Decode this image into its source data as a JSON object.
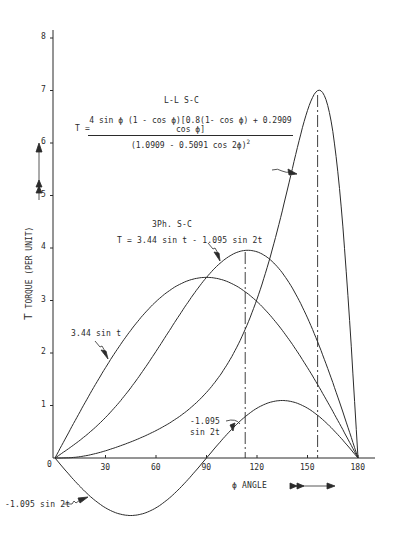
{
  "chart_data": {
    "type": "line",
    "title": "",
    "xlabel": "ϕ ANGLE",
    "ylabel": "T  TORQUE (PER UNIT)",
    "xlim": [
      0,
      180
    ],
    "ylim": [
      -1.2,
      8
    ],
    "x_ticks": [
      0,
      30,
      60,
      90,
      120,
      150,
      180
    ],
    "y_ticks": [
      1,
      2,
      3,
      4,
      5,
      6,
      7,
      8
    ],
    "grid": false,
    "series": [
      {
        "name": "L-L S-C",
        "formula": "T = 4 sinϕ(1-cosϕ)[0.8(1-cosϕ)+0.2909cosϕ]/(1.0909-0.5091cos2ϕ)^2",
        "x": [
          0,
          15,
          30,
          45,
          60,
          75,
          90,
          105,
          120,
          135,
          150,
          156,
          165,
          180
        ],
        "values": [
          0,
          0.02,
          0.1,
          0.3,
          0.66,
          1.2,
          1.92,
          2.82,
          3.93,
          5.2,
          6.54,
          6.99,
          5.65,
          0
        ]
      },
      {
        "name": "3Ph. S-C",
        "formula": "T = 3.44 sin t - 1.095 sin 2t",
        "x": [
          0,
          15,
          30,
          45,
          60,
          75,
          90,
          105,
          113,
          120,
          135,
          150,
          165,
          180
        ],
        "values": [
          0,
          0.34,
          0.77,
          1.34,
          2.03,
          2.78,
          3.44,
          3.87,
          3.96,
          3.93,
          3.53,
          2.67,
          1.44,
          0
        ]
      },
      {
        "name": "3.44 sin t",
        "x": [
          0,
          30,
          60,
          90,
          120,
          150,
          180
        ],
        "values": [
          0,
          1.72,
          2.98,
          3.44,
          2.98,
          1.72,
          0
        ]
      },
      {
        "name": "-1.095 sin 2t",
        "x": [
          0,
          30,
          45,
          60,
          90,
          120,
          135,
          150,
          180
        ],
        "values": [
          0,
          -0.95,
          -1.095,
          -0.95,
          0,
          0.95,
          1.095,
          0.95,
          0
        ]
      }
    ],
    "reference_lines": [
      {
        "type": "dash-dot vertical",
        "x": 113
      },
      {
        "type": "dash-dot vertical",
        "x": 156
      }
    ],
    "annotations": [
      "L-L S-C",
      "T = 4 sin ϕ (1 - cos ϕ)[0.8(1- cos ϕ) + 0.2909 cos ϕ] / (1.0909 - 0.5091 cos 2ϕ)^2",
      "3Ph. S-C",
      "T = 3.44 sin t - 1.095 sin 2t",
      "3.44 sin t",
      "-1.095 sin 2t"
    ]
  },
  "labels": {
    "ll_title": "L-L S-C",
    "ll_T": "T =",
    "ll_num": "4 sin ϕ (1 - cos ϕ)[0.8(1- cos ϕ) + 0.2909 cos ϕ]",
    "ll_den": "(1.0909 - 0.5091 cos 2ϕ)",
    "ll_den_exp": "2",
    "ph3_title": "3Ph. S-C",
    "ph3_formula": "T = 3.44 sin t - 1.095 sin 2t",
    "sin_t": "3.44 sin t",
    "sin2t_upper_1": "-1.095",
    "sin2t_upper_2": "sin 2t",
    "sin2t_lower": "-1.095 sin 2t",
    "ylabel_T": "T",
    "ylabel_text": "TORQUE (PER UNIT)",
    "xlabel": "ϕ ANGLE",
    "origin": "0",
    "xticks": [
      "30",
      "60",
      "90",
      "120",
      "150",
      "180"
    ],
    "yticks": [
      "1",
      "2",
      "3",
      "4",
      "5",
      "6",
      "7",
      "8"
    ]
  },
  "colors": {
    "ink": "#2b2b2b",
    "background": "#ffffff"
  }
}
